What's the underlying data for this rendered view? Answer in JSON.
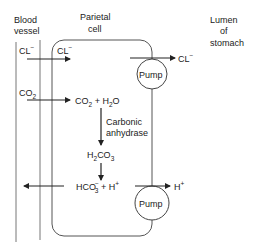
{
  "regions": {
    "blood_vessel": [
      "Blood",
      "vessel"
    ],
    "parietal_cell": [
      "Parietal",
      "cell"
    ],
    "lumen": [
      "Lumen",
      "of",
      "stomach"
    ]
  },
  "labels": {
    "cl_blood": "CL",
    "cl_cell": "CL",
    "cl_lumen": "CL",
    "co2_blood": "CO",
    "co2_h2o": "CO",
    "plus_h2o": " + H",
    "o": "O",
    "enzyme": [
      "Carbonic",
      "anhydrase"
    ],
    "h2co3_h": "H",
    "h2co3_co": "CO",
    "hco3": "HCO",
    "plus_h": " + H",
    "h_lumen": "H",
    "charge_minus": "−",
    "charge_plus": "+",
    "sub2": "2",
    "sub3": "3"
  },
  "pumps": {
    "upper": "Pump",
    "lower": "Pump"
  },
  "colors": {
    "line": "#222222",
    "light_line": "#555555"
  }
}
